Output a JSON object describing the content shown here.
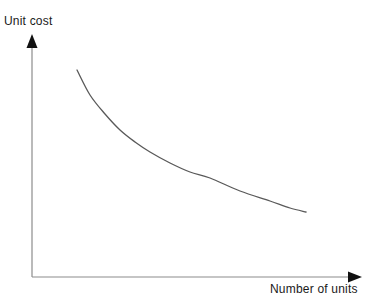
{
  "chart_data": {
    "type": "line",
    "title": "",
    "subtitle": "",
    "xlabel": "Number of units",
    "ylabel": "Unit cost",
    "grid": false,
    "legend": null,
    "legend_position": "none",
    "axis_style": "arrow-headed open axes, no tick marks, no tick labels",
    "xlim": [
      0,
      1
    ],
    "ylim": [
      0,
      1
    ],
    "series": [
      {
        "name": "Unit cost curve",
        "description": "Smooth convex decreasing curve: unit cost falls steeply at first, then flattens as the number of units increases (economies of scale / experience curve).",
        "color": "#595959",
        "line_width": 1.3,
        "x": [
          0.0,
          0.1,
          0.2,
          0.3,
          0.4,
          0.5,
          0.6,
          0.7,
          0.8,
          0.9,
          1.0
        ],
        "y": [
          1.0,
          0.8,
          0.645,
          0.53,
          0.44,
          0.365,
          0.3,
          0.245,
          0.195,
          0.145,
          0.1
        ],
        "pixel_points": [
          [
            77,
            70
          ],
          [
            90,
            95
          ],
          [
            105,
            114
          ],
          [
            120,
            130
          ],
          [
            135,
            142
          ],
          [
            150,
            152
          ],
          [
            170,
            163
          ],
          [
            190,
            172
          ],
          [
            210,
            178
          ],
          [
            240,
            191
          ],
          [
            270,
            201
          ],
          [
            290,
            208
          ],
          [
            306,
            212
          ]
        ]
      }
    ],
    "annotations": []
  },
  "labels": {
    "y_axis": "Unit cost",
    "x_axis": "Number of units"
  },
  "icons": {
    "y_arrow": "arrow-up-icon",
    "x_arrow": "arrow-right-icon"
  },
  "colors": {
    "background": "#ffffff",
    "axis": "#8c8c8c",
    "arrow": "#111111",
    "curve": "#595959",
    "text": "#1a1a1a"
  },
  "geometry": {
    "width": 374,
    "height": 305,
    "origin_x": 32,
    "origin_y": 277,
    "y_axis_top": 37,
    "x_axis_right": 360
  }
}
